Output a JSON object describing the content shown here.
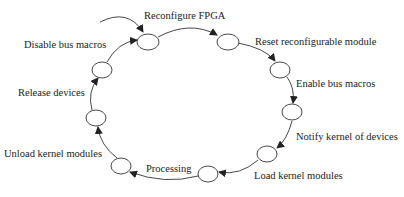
{
  "diagram": {
    "type": "state-cycle",
    "stroke_color": "#333333",
    "states": [
      {
        "id": "n1",
        "label": "Reconfigure FPGA"
      },
      {
        "id": "n2",
        "label": "Reset reconfigurable module"
      },
      {
        "id": "n3",
        "label": "Enable bus macros"
      },
      {
        "id": "n4",
        "label": "Notify kernel of devices"
      },
      {
        "id": "n5",
        "label": "Load kernel modules"
      },
      {
        "id": "n6",
        "label": "Processing"
      },
      {
        "id": "n7",
        "label": "Unload kernel modules"
      },
      {
        "id": "n8",
        "label": "Release devices"
      },
      {
        "id": "n9",
        "label": "Disable bus macros"
      }
    ],
    "transitions": [
      {
        "from": "start",
        "to": "n1"
      },
      {
        "from": "n1",
        "to": "n2"
      },
      {
        "from": "n2",
        "to": "n3"
      },
      {
        "from": "n3",
        "to": "n4"
      },
      {
        "from": "n4",
        "to": "n5"
      },
      {
        "from": "n5",
        "to": "n6"
      },
      {
        "from": "n6",
        "to": "n7"
      },
      {
        "from": "n7",
        "to": "n8"
      },
      {
        "from": "n8",
        "to": "n9"
      },
      {
        "from": "n9",
        "to": "n1"
      }
    ]
  }
}
